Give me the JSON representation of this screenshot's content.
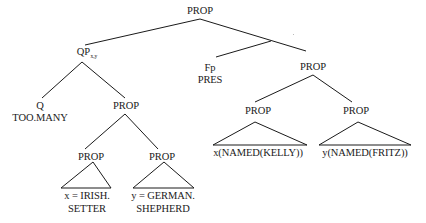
{
  "diagram": {
    "type": "syntax-tree",
    "nodes": {
      "root": "PROP",
      "qp": {
        "label": "QP",
        "subscript": "x,y"
      },
      "q": {
        "label": "Q",
        "value": "TOO.MANY"
      },
      "qp_prop": "PROP",
      "restrictor_left": {
        "label": "PROP",
        "line1": "x = IRISH.",
        "line2": "SETTER"
      },
      "restrictor_right": {
        "label": "PROP",
        "line1": "y = GERMAN.",
        "line2": "SHEPHERD"
      },
      "fp": {
        "label": "Fp",
        "value": "PRES"
      },
      "scope_prop": "PROP",
      "scope_left": {
        "label": "PROP",
        "content": "x(NAMED(KELLY))"
      },
      "scope_right": {
        "label": "PROP",
        "content": "y(NAMED(FRITZ))"
      }
    },
    "line_color": "#1a1a1a"
  }
}
